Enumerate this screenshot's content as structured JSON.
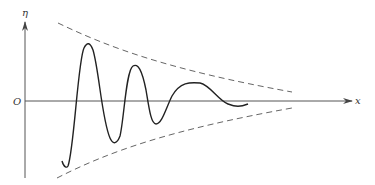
{
  "diagram": {
    "axes": {
      "y_label": "η",
      "x_label": "x",
      "origin_label": "O"
    },
    "colors": {
      "axis": "#555555",
      "curve": "#222222",
      "envelope": "#666666",
      "background": "#ffffff"
    },
    "elements": [
      {
        "name": "curve",
        "style": "solid",
        "description": "damped oscillating wave"
      },
      {
        "name": "upper-envelope",
        "style": "dashed"
      },
      {
        "name": "lower-envelope",
        "style": "dashed"
      }
    ]
  }
}
